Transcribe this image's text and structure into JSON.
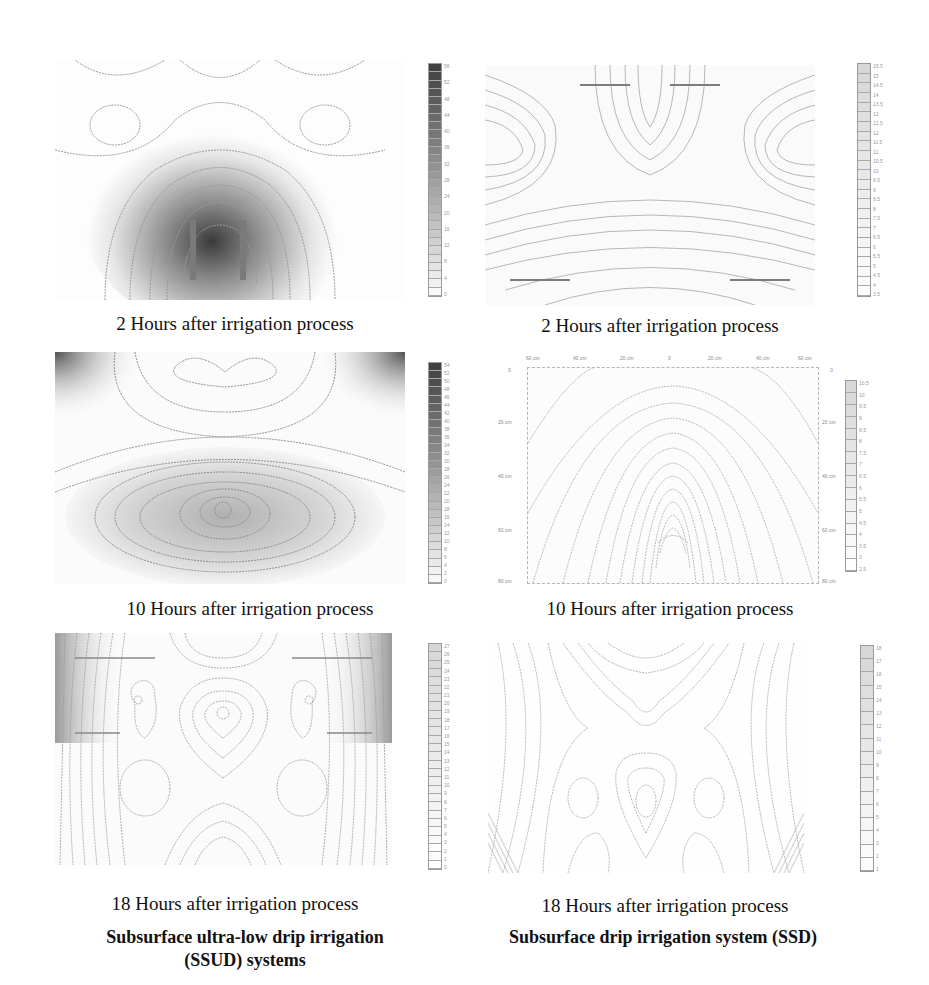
{
  "chart_data": [
    {
      "type": "heatmap",
      "subtype": "contour",
      "system": "SSUD",
      "title": "2 Hours after irrigation process",
      "colorbar": {
        "min": 0,
        "max": 56,
        "step": 2,
        "tick_labels": [
          "56",
          "52",
          "48",
          "44",
          "40",
          "36",
          "32",
          "28",
          "24",
          "20",
          "16",
          "12",
          "8",
          "4",
          "0"
        ]
      },
      "pattern": "bulb centered at lower-middle; maximum ~56 near center depth, decreasing outward",
      "shading": "dark gray center"
    },
    {
      "type": "heatmap",
      "subtype": "contour",
      "system": "SSD",
      "title": "2 Hours after irrigation process",
      "colorbar": {
        "min": 3.5,
        "max": 15.5,
        "step": 0.5,
        "tick_labels": [
          "15.5",
          "15",
          "14.5",
          "14",
          "13.5",
          "13",
          "12.5",
          "12",
          "11.5",
          "11",
          "10.5",
          "10",
          "9.5",
          "9",
          "8.5",
          "8",
          "7.5",
          "7",
          "6.5",
          "6",
          "5.5",
          "5",
          "4.5",
          "4",
          "3.5"
        ]
      },
      "pattern": "dense contour lines; saddle in middle; concave bands near top and bottom",
      "shading": "light"
    },
    {
      "type": "heatmap",
      "subtype": "contour",
      "system": "SSUD",
      "title": "10 Hours after irrigation process",
      "colorbar": {
        "min": 0,
        "max": 54,
        "step": 2,
        "tick_labels": [
          "54",
          "52",
          "50",
          "48",
          "46",
          "44",
          "42",
          "40",
          "38",
          "36",
          "34",
          "32",
          "30",
          "28",
          "26",
          "24",
          "22",
          "20",
          "18",
          "16",
          "14",
          "12",
          "10",
          "8",
          "6",
          "4",
          "2",
          "0"
        ]
      },
      "pattern": "horizontal elliptical bulb centered at lower-middle; dark corners top-left and top-right",
      "shading": "medium gray ellipse, dark top corners"
    },
    {
      "type": "heatmap",
      "subtype": "contour",
      "system": "SSD",
      "title": "10 Hours after irrigation process",
      "x_axis": {
        "tick_labels": [
          "60 cm",
          "40 cm",
          "20 cm",
          "0",
          "20 cm",
          "40 cm",
          "60 cm"
        ]
      },
      "y_axis": {
        "tick_labels": [
          "0",
          "20 cm",
          "40 cm",
          "60 cm",
          "80 cm"
        ]
      },
      "colorbar": {
        "min": 2.5,
        "max": 10.5,
        "step": 0.5,
        "tick_labels": [
          "10.5",
          "10",
          "9.5",
          "9",
          "8.5",
          "8",
          "7.5",
          "7",
          "6.5",
          "6",
          "5.5",
          "5",
          "4.5",
          "4",
          "3.5",
          "3",
          "2.5"
        ]
      },
      "pattern": "nested arch-shaped contours rising from bottom center",
      "shading": "light"
    },
    {
      "type": "heatmap",
      "subtype": "contour",
      "system": "SSUD",
      "title": "18 Hours after irrigation process",
      "colorbar": {
        "min": 0,
        "max": 27,
        "step": 1,
        "tick_labels": [
          "27",
          "26",
          "25",
          "24",
          "23",
          "22",
          "21",
          "20",
          "19",
          "18",
          "17",
          "16",
          "15",
          "14",
          "13",
          "12",
          "11",
          "10",
          "9",
          "8",
          "7",
          "6",
          "5",
          "4",
          "3",
          "2",
          "1",
          "0"
        ]
      },
      "pattern": "central closed contours near top, side loops, dense vertical lines at left/right edges",
      "shading": "gray at upper sides"
    },
    {
      "type": "heatmap",
      "subtype": "contour",
      "system": "SSD",
      "title": "18 Hours after irrigation process",
      "colorbar": {
        "min": 1,
        "max": 18,
        "step": 1,
        "tick_labels": [
          "18",
          "17",
          "16",
          "15",
          "14",
          "13",
          "12",
          "11",
          "10",
          "9",
          "8",
          "7",
          "6",
          "5",
          "4",
          "3",
          "2",
          "1"
        ]
      },
      "pattern": "saddle at upper center, three closed loops at mid depth, dense lines at bottom corners",
      "shading": "light"
    }
  ],
  "captions": {
    "r1_left": "2 Hours after irrigation process",
    "r1_right": "2 Hours after irrigation process",
    "r2_left": "10 Hours after irrigation process",
    "r2_right": "10 Hours after irrigation process",
    "r3_left": "18 Hours after irrigation process",
    "r3_right": "18 Hours after irrigation process"
  },
  "footers": {
    "left": "Subsurface ultra-low drip irrigation (SSUD) systems",
    "right": "Subsurface drip irrigation system (SSD)"
  },
  "colors": {
    "line": "#9a9a9a",
    "dark": "#3a3a3a",
    "background": "#ffffff"
  }
}
